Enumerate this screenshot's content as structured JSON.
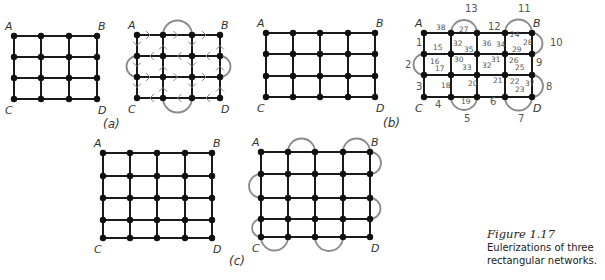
{
  "figure": {
    "caption_label": "Figure 1.17",
    "caption_text": "Eulerizations of three rectangular networks.",
    "colors": {
      "edge": "#1a1a1a",
      "added_edge": "#8a8a8a",
      "vertex": "#111111",
      "text": "#333333"
    }
  },
  "panels": [
    {
      "id": "a",
      "label": "(a)",
      "corners": [
        "A",
        "B",
        "C",
        "D"
      ],
      "grid": "3x3 blocks (4x4 vertices)",
      "original": {
        "xs": [
          14,
          41,
          69,
          97
        ],
        "ys": [
          36,
          57,
          78,
          99
        ]
      },
      "eulerized": {
        "xs": [
          137,
          163,
          192,
          220
        ],
        "ys": [
          35,
          56,
          77,
          98
        ],
        "added_edges": [
          {
            "side": "top",
            "from": 1,
            "to": 2
          },
          {
            "side": "bottom",
            "from": 1,
            "to": 2
          },
          {
            "side": "left",
            "from": 1,
            "to": 2
          },
          {
            "side": "right",
            "from": 1,
            "to": 2
          }
        ],
        "annotation": "direction arrows drawn along edges"
      }
    },
    {
      "id": "b",
      "label": "(b)",
      "corners": [
        "A",
        "B",
        "C",
        "D"
      ],
      "grid": "4x3 blocks (5x4 vertices)",
      "original": {
        "xs": [
          266,
          293,
          320,
          348,
          375
        ],
        "ys": [
          33,
          54,
          76,
          97
        ]
      },
      "eulerized": {
        "xs": [
          424,
          451,
          477,
          505,
          532
        ],
        "ys": [
          33,
          54,
          75,
          97
        ],
        "added_edges": [
          {
            "side": "top",
            "from": 1,
            "to": 2,
            "label": "13"
          },
          {
            "side": "top",
            "from": 3,
            "to": 4,
            "label": "11"
          },
          {
            "side": "right",
            "from": 0,
            "to": 1,
            "label": "10"
          },
          {
            "side": "right",
            "from": 2,
            "to": 3,
            "label": "8"
          },
          {
            "side": "left",
            "from": 1,
            "to": 2,
            "label": "2"
          },
          {
            "side": "bottom",
            "from": 1,
            "to": 2,
            "label": "5"
          },
          {
            "side": "bottom",
            "from": 3,
            "to": 4,
            "label": "7"
          }
        ],
        "edge_numbers": [
          "1",
          "2",
          "3",
          "4",
          "5",
          "6",
          "7",
          "8",
          "9",
          "10",
          "11",
          "12",
          "13",
          "14",
          "15",
          "16",
          "17",
          "18",
          "19",
          "20",
          "21",
          "22",
          "23",
          "24",
          "25",
          "26",
          "27",
          "28",
          "29",
          "30",
          "31",
          "32",
          "33",
          "34",
          "35",
          "36",
          "37",
          "38"
        ]
      }
    },
    {
      "id": "c",
      "label": "(c)",
      "corners": [
        "A",
        "B",
        "C",
        "D"
      ],
      "grid": "4x4 blocks (5x5 vertices)",
      "original": {
        "xs": [
          103,
          130,
          157,
          185,
          212
        ],
        "ys": [
          153,
          176,
          198,
          220,
          238
        ]
      },
      "eulerized": {
        "xs": [
          261,
          288,
          315,
          343,
          370
        ],
        "ys": [
          152,
          174,
          198,
          219,
          237
        ],
        "added_edges": [
          {
            "side": "top",
            "from": 1,
            "to": 2
          },
          {
            "side": "top",
            "from": 3,
            "to": 4
          },
          {
            "side": "right",
            "from": 0,
            "to": 1
          },
          {
            "side": "right",
            "from": 2,
            "to": 3
          },
          {
            "side": "left",
            "from": 1,
            "to": 2
          },
          {
            "side": "left",
            "from": 3,
            "to": 4
          },
          {
            "side": "bottom",
            "from": 0,
            "to": 1
          },
          {
            "side": "bottom",
            "from": 2,
            "to": 3
          }
        ]
      }
    }
  ],
  "labels_b": [
    {
      "t": "38",
      "x": 436,
      "y": 30
    },
    {
      "t": "27",
      "x": 459,
      "y": 32
    },
    {
      "t": "12",
      "x": 488,
      "y": 30
    },
    {
      "t": "1",
      "x": 416,
      "y": 46
    },
    {
      "t": "15",
      "x": 433,
      "y": 50
    },
    {
      "t": "32",
      "x": 453,
      "y": 46
    },
    {
      "t": "35",
      "x": 464,
      "y": 52
    },
    {
      "t": "36",
      "x": 482,
      "y": 46
    },
    {
      "t": "34",
      "x": 496,
      "y": 47
    },
    {
      "t": "24",
      "x": 510,
      "y": 37
    },
    {
      "t": "28",
      "x": 523,
      "y": 45
    },
    {
      "t": "29",
      "x": 512,
      "y": 52
    },
    {
      "t": "16",
      "x": 430,
      "y": 64
    },
    {
      "t": "17",
      "x": 435,
      "y": 71
    },
    {
      "t": "30",
      "x": 454,
      "y": 62
    },
    {
      "t": "33",
      "x": 462,
      "y": 70
    },
    {
      "t": "31",
      "x": 491,
      "y": 62
    },
    {
      "t": "32",
      "x": 482,
      "y": 68
    },
    {
      "t": "26",
      "x": 509,
      "y": 63
    },
    {
      "t": "25",
      "x": 515,
      "y": 70
    },
    {
      "t": "9",
      "x": 536,
      "y": 66
    },
    {
      "t": "3",
      "x": 416,
      "y": 90
    },
    {
      "t": "18",
      "x": 441,
      "y": 88
    },
    {
      "t": "20",
      "x": 468,
      "y": 86
    },
    {
      "t": "21",
      "x": 493,
      "y": 83
    },
    {
      "t": "22",
      "x": 510,
      "y": 84
    },
    {
      "t": "37",
      "x": 525,
      "y": 86
    },
    {
      "t": "23",
      "x": 515,
      "y": 92
    },
    {
      "t": "4",
      "x": 435,
      "y": 108
    },
    {
      "t": "19",
      "x": 461,
      "y": 104
    },
    {
      "t": "6",
      "x": 490,
      "y": 105
    },
    {
      "t": "13",
      "x": 465,
      "y": 12
    },
    {
      "t": "11",
      "x": 518,
      "y": 12
    },
    {
      "t": "10",
      "x": 550,
      "y": 46
    },
    {
      "t": "8",
      "x": 546,
      "y": 90
    },
    {
      "t": "2",
      "x": 405,
      "y": 68
    },
    {
      "t": "5",
      "x": 464,
      "y": 122
    },
    {
      "t": "7",
      "x": 518,
      "y": 122
    }
  ]
}
